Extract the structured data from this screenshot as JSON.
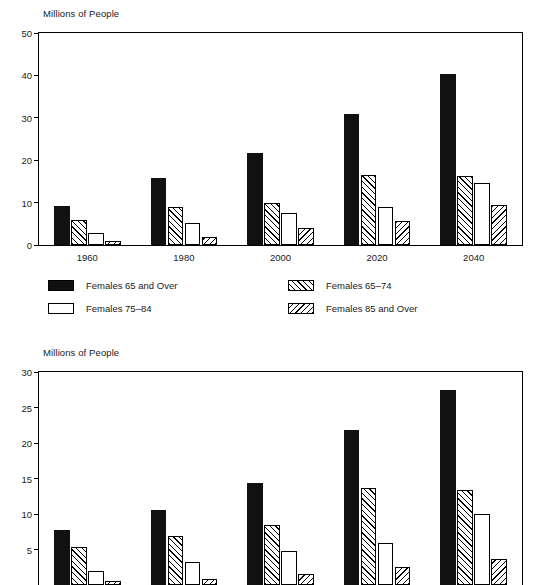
{
  "charts": [
    {
      "id": "top",
      "ylabel": "Millions of People",
      "categories": [
        "1960",
        "1980",
        "2000",
        "2020",
        "2040"
      ],
      "yticks": [
        "0",
        "10",
        "20",
        "30",
        "40",
        "50"
      ],
      "series": [
        {
          "name": "Females 65 and Over",
          "style": "solid",
          "values": [
            9.1,
            15.7,
            21.6,
            30.8,
            40.4
          ]
        },
        {
          "name": "Females 65–74",
          "style": "fwd",
          "values": [
            6.0,
            9.0,
            10.0,
            16.4,
            16.2
          ]
        },
        {
          "name": "Females 75–84",
          "style": "white",
          "values": [
            2.9,
            5.1,
            7.6,
            8.9,
            14.7
          ]
        },
        {
          "name": "Females 85 and Over",
          "style": "back",
          "values": [
            1.0,
            1.8,
            4.0,
            5.7,
            9.4
          ]
        }
      ]
    },
    {
      "id": "bottom",
      "ylabel": "Millions of People",
      "categories": [
        "1960",
        "1980",
        "2000",
        "2020",
        "2040"
      ],
      "yticks": [
        "5",
        "10",
        "15",
        "20",
        "25",
        "30"
      ],
      "series": [
        {
          "name": "Males 65 and Over",
          "style": "solid",
          "values": [
            7.7,
            10.5,
            14.4,
            21.8,
            27.4
          ]
        },
        {
          "name": "Males 65–74",
          "style": "fwd",
          "values": [
            5.3,
            6.9,
            8.4,
            13.7,
            13.4
          ]
        },
        {
          "name": "Males 75–84",
          "style": "white",
          "values": [
            2.0,
            3.2,
            4.8,
            5.9,
            10.0
          ]
        },
        {
          "name": "Males 85 and Over",
          "style": "back",
          "values": [
            0.5,
            0.9,
            1.5,
            2.5,
            3.6
          ]
        }
      ]
    }
  ],
  "legend": {
    "items": [
      {
        "label": "Females 65 and Over",
        "style": "solid"
      },
      {
        "label": "Females 65–74",
        "style": "fwd"
      },
      {
        "label": "Females 75–84",
        "style": "white"
      },
      {
        "label": "Females 85 and Over",
        "style": "back"
      }
    ]
  },
  "chart_data": {
    "type": "bar",
    "title": "",
    "subtitle": "",
    "panels": [
      {
        "panel": "top",
        "type": "bar",
        "title": "",
        "xlabel": "",
        "ylabel": "Millions of People",
        "categories": [
          "1960",
          "1980",
          "2000",
          "2020",
          "2040"
        ],
        "ylim": [
          0,
          50
        ],
        "ytick_values": [
          0,
          10,
          20,
          30,
          40,
          50
        ],
        "grid": false,
        "legend_position": "below-plot",
        "series": [
          {
            "name": "Females 65 and Over",
            "values": [
              9.1,
              15.7,
              21.6,
              30.8,
              40.4
            ]
          },
          {
            "name": "Females 65–74",
            "values": [
              6.0,
              9.0,
              10.0,
              16.4,
              16.2
            ]
          },
          {
            "name": "Females 75–84",
            "values": [
              2.9,
              5.1,
              7.6,
              8.9,
              14.7
            ]
          },
          {
            "name": "Females 85 and Over",
            "values": [
              1.0,
              1.8,
              4.0,
              5.7,
              9.4
            ]
          }
        ]
      },
      {
        "panel": "bottom",
        "type": "bar",
        "title": "",
        "xlabel": "",
        "ylabel": "Millions of People",
        "categories": [
          "1960",
          "1980",
          "2000",
          "2020",
          "2040"
        ],
        "ylim": [
          0,
          30
        ],
        "ytick_values": [
          5,
          10,
          15,
          20,
          25,
          30
        ],
        "grid": false,
        "legend_position": "not-visible-cropped",
        "note": "panel is cropped by the bottom edge of the image",
        "series": [
          {
            "name": "Males 65 and Over",
            "values": [
              7.7,
              10.5,
              14.4,
              21.8,
              27.4
            ]
          },
          {
            "name": "Males 65–74",
            "values": [
              5.3,
              6.9,
              8.4,
              13.7,
              13.4
            ]
          },
          {
            "name": "Males 75–84",
            "values": [
              2.0,
              3.2,
              4.8,
              5.9,
              10.0
            ]
          },
          {
            "name": "Males 85 and Over",
            "values": [
              0.5,
              0.9,
              1.5,
              2.5,
              3.6
            ]
          }
        ]
      }
    ]
  }
}
